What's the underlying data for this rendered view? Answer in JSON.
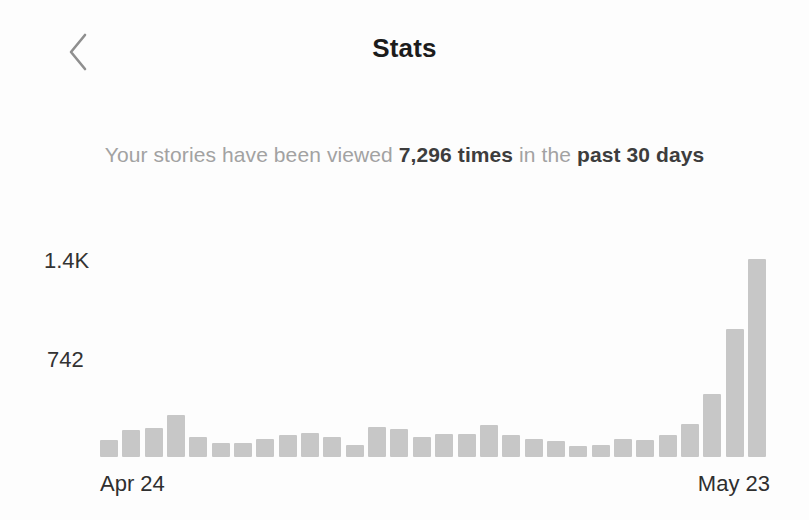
{
  "header": {
    "title": "Stats"
  },
  "summary": {
    "prefix": "Your stories have been viewed ",
    "views_highlight": "7,296 times",
    "middle": " in the ",
    "period_highlight": "past 30 days"
  },
  "chart_data": {
    "type": "bar",
    "total_views_shown": "7,296",
    "categories": [
      "Apr 24",
      "Apr 25",
      "Apr 26",
      "Apr 27",
      "Apr 28",
      "Apr 29",
      "Apr 30",
      "May 1",
      "May 2",
      "May 3",
      "May 4",
      "May 5",
      "May 6",
      "May 7",
      "May 8",
      "May 9",
      "May 10",
      "May 11",
      "May 12",
      "May 13",
      "May 14",
      "May 15",
      "May 16",
      "May 17",
      "May 18",
      "May 19",
      "May 20",
      "May 21",
      "May 22",
      "May 23"
    ],
    "values": [
      128,
      202,
      217,
      315,
      150,
      105,
      105,
      135,
      165,
      180,
      150,
      90,
      225,
      210,
      150,
      172,
      172,
      240,
      165,
      135,
      120,
      82,
      90,
      135,
      127,
      165,
      247,
      475,
      960,
      1484
    ],
    "y_ticks": [
      {
        "label": "1.4K",
        "value": 1484
      },
      {
        "label": "742",
        "value": 742
      }
    ],
    "x_tick_labels": {
      "first": "Apr 24",
      "last": "May 23"
    },
    "ylim": [
      0,
      1484
    ],
    "grid": false,
    "legend": false,
    "bar_color": "#c7c7c7"
  },
  "colors": {
    "background": "#fdfdfd",
    "title_text": "#1c1c1c",
    "muted_text": "#a2a2a2",
    "strong_text": "#3d3d3d",
    "axis_text": "#2f2f2f",
    "bar": "#c7c7c7",
    "chevron": "#8f8f8f"
  }
}
